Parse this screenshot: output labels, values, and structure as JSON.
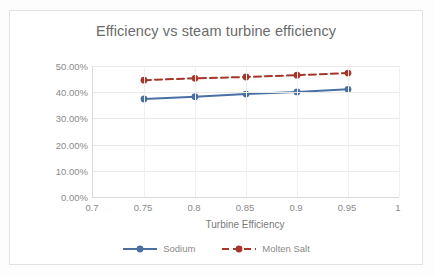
{
  "chart_data": {
    "type": "line",
    "title": "Efficiency vs steam turbine efficiency",
    "xlabel": "Turbine Efficiency",
    "ylabel": "Thermodynamic Efficiency",
    "xlim": [
      0.7,
      1.0
    ],
    "ylim": [
      0,
      0.5
    ],
    "x": [
      0.75,
      0.8,
      0.85,
      0.9,
      0.95
    ],
    "xticks": [
      "0.7",
      "0.75",
      "0.8",
      "0.85",
      "0.9",
      "0.95",
      "1"
    ],
    "xtick_values": [
      0.7,
      0.75,
      0.8,
      0.85,
      0.9,
      0.95,
      1.0
    ],
    "yticks": [
      "0.00%",
      "10.00%",
      "20.00%",
      "30.00%",
      "40.00%",
      "50.00%"
    ],
    "ytick_values": [
      0,
      10,
      20,
      30,
      40,
      50
    ],
    "grid": "horizontal-and-vertical",
    "legend_position": "bottom",
    "series": [
      {
        "name": "Sodium",
        "color": "#4A6FA5",
        "linestyle": "solid",
        "marker": "circle",
        "values": [
          37.4,
          38.3,
          39.3,
          40.1,
          41.1
        ]
      },
      {
        "name": "Molten Salt",
        "color": "#A8352A",
        "linestyle": "dashed",
        "marker": "circle",
        "values": [
          44.6,
          45.3,
          45.8,
          46.5,
          47.3
        ]
      }
    ]
  },
  "legend": {
    "items": [
      {
        "label": "Sodium"
      },
      {
        "label": "Molten Salt"
      }
    ]
  },
  "colors": {
    "sodium": "#4A6FA5",
    "molten_salt": "#A8352A",
    "text": "#8a8a8a",
    "title_text": "#6b6b6b",
    "gridline": "#e8e8e8",
    "axis": "#d9d9d9",
    "background": "#ffffff"
  }
}
